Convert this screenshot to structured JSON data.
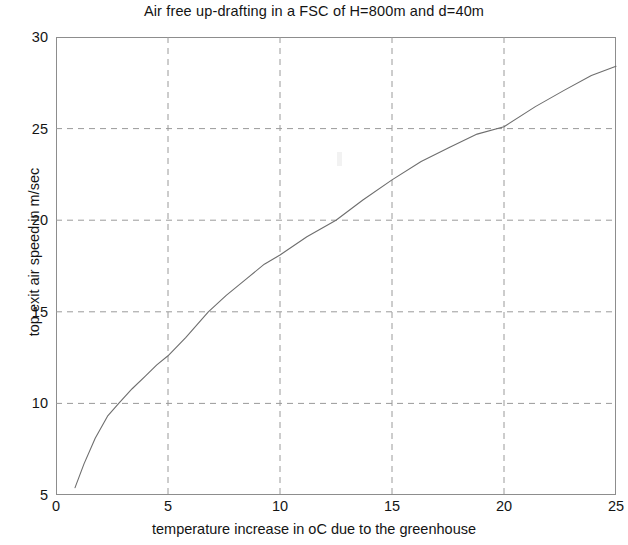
{
  "chart_data": {
    "type": "line",
    "title": "Air free up-drafting in a FSC of H=800m and d=40m",
    "xlabel": "temperature increase in oC due to the greenhouse",
    "ylabel": "top exit  air speed in m/sec",
    "xlim": [
      0,
      25
    ],
    "ylim": [
      5,
      30
    ],
    "xticks": [
      0,
      5,
      10,
      15,
      20,
      25
    ],
    "yticks": [
      5,
      10,
      15,
      20,
      25,
      30
    ],
    "xtick_labels": [
      "0",
      "5",
      "10",
      "15",
      "20",
      "25"
    ],
    "ytick_labels": [
      "5",
      "10",
      "15",
      "20",
      "25",
      "30"
    ],
    "grid": true,
    "grid_style": "dashed",
    "grid_color": "#9a9a9a",
    "legend": null,
    "line_color": "#6e6e6e",
    "line_width": 1.1,
    "frame_color": "#8d8d8d",
    "background": "#ffffff",
    "series": [
      {
        "name": "top exit air speed",
        "x": [
          0.85,
          1.25,
          1.75,
          2.3,
          2.8,
          3.4,
          4.0,
          4.5,
          5.0,
          5.8,
          6.8,
          7.6,
          8.5,
          9.3,
          10.0,
          11.2,
          12.5,
          13.7,
          15.0,
          16.3,
          17.6,
          18.8,
          20.0,
          21.4,
          22.7,
          23.9,
          25.0
        ],
        "y": [
          5.4,
          6.7,
          8.1,
          9.3,
          10.0,
          10.8,
          11.5,
          12.1,
          12.6,
          13.6,
          15.0,
          15.9,
          16.8,
          17.6,
          18.1,
          19.1,
          20.0,
          21.1,
          22.2,
          23.2,
          24.0,
          24.7,
          25.1,
          26.2,
          27.1,
          27.9,
          28.4
        ]
      }
    ]
  }
}
